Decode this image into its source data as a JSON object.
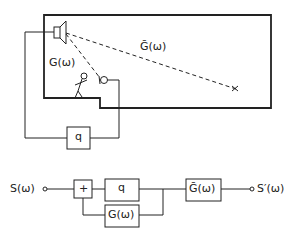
{
  "room": {
    "g_label": "G(ω)",
    "gbar_label": "Ḡ(ω)",
    "amp_label": "q"
  },
  "block_diagram": {
    "input_label": "S(ω)",
    "output_label": "S′(ω)",
    "sum_label": "+",
    "gain_label": "q",
    "feedback_label": "G(ω)",
    "path_label": "Ḡ(ω)"
  },
  "colors": {
    "ink": "#222222",
    "background": "#ffffff"
  }
}
